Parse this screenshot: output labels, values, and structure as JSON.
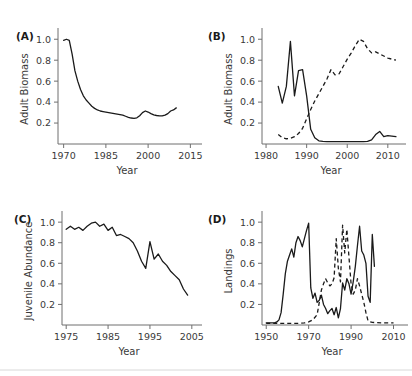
{
  "figure": {
    "background": "#ffffff",
    "line_color": "#1a1a1a",
    "axis_color": "#6f6f6f",
    "text_color": "#3a3a3a"
  },
  "panels": [
    {
      "id": "A",
      "label": "(A)"
    },
    {
      "id": "B",
      "label": "(B)"
    },
    {
      "id": "C",
      "label": "(C)"
    },
    {
      "id": "D",
      "label": "(D)"
    }
  ],
  "chart_data": [
    {
      "panel": "A",
      "type": "line",
      "title": "(A)",
      "xlabel": "Year",
      "ylabel": "Adult Biomass",
      "xlim": [
        1968,
        2017
      ],
      "ylim": [
        0.0,
        1.05
      ],
      "xticks": [
        1970,
        1985,
        2000,
        2015
      ],
      "yticks": [
        0.2,
        0.4,
        0.6,
        0.8,
        1.0
      ],
      "grid": false,
      "legend": "none",
      "series": [
        {
          "name": "adult biomass",
          "style": "solid",
          "x": [
            1970,
            1971,
            1972,
            1973,
            1974,
            1975,
            1976,
            1977,
            1978,
            1979,
            1980,
            1981,
            1982,
            1983,
            1984,
            1985,
            1986,
            1987,
            1988,
            1989,
            1990,
            1991,
            1992,
            1993,
            1994,
            1995,
            1996,
            1997,
            1998,
            1999,
            2000,
            2001,
            2002,
            2003,
            2004,
            2005,
            2006,
            2007,
            2008,
            2009,
            2010
          ],
          "values": [
            0.99,
            1.0,
            0.99,
            0.86,
            0.7,
            0.6,
            0.52,
            0.46,
            0.42,
            0.39,
            0.36,
            0.34,
            0.325,
            0.315,
            0.31,
            0.305,
            0.3,
            0.295,
            0.29,
            0.285,
            0.28,
            0.275,
            0.265,
            0.255,
            0.248,
            0.245,
            0.25,
            0.27,
            0.3,
            0.315,
            0.305,
            0.29,
            0.278,
            0.272,
            0.268,
            0.268,
            0.275,
            0.29,
            0.315,
            0.325,
            0.345
          ]
        }
      ]
    },
    {
      "panel": "B",
      "type": "line",
      "title": "(B)",
      "xlabel": "Year",
      "ylabel": "Adult Biomass",
      "xlim": [
        1979,
        2013
      ],
      "ylim": [
        0.0,
        1.05
      ],
      "xticks": [
        1980,
        1990,
        2000,
        2010
      ],
      "yticks": [
        0.2,
        0.4,
        0.6,
        0.8,
        1.0
      ],
      "grid": false,
      "legend": "none",
      "series": [
        {
          "name": "solid stock",
          "style": "solid",
          "x": [
            1983,
            1984,
            1985,
            1986,
            1987,
            1988,
            1989,
            1990,
            1991,
            1992,
            1993,
            1994,
            1995,
            1996,
            1997,
            1998,
            1999,
            2000,
            2001,
            2002,
            2003,
            2004,
            2005,
            2006,
            2007,
            2008,
            2009,
            2010,
            2011,
            2012
          ],
          "values": [
            0.55,
            0.39,
            0.55,
            0.98,
            0.46,
            0.7,
            0.71,
            0.46,
            0.14,
            0.06,
            0.03,
            0.025,
            0.022,
            0.022,
            0.022,
            0.022,
            0.022,
            0.022,
            0.022,
            0.022,
            0.022,
            0.022,
            0.025,
            0.04,
            0.09,
            0.12,
            0.07,
            0.08,
            0.075,
            0.07
          ]
        },
        {
          "name": "dashed stock",
          "style": "dashed",
          "x": [
            1983,
            1984,
            1985,
            1986,
            1987,
            1988,
            1989,
            1990,
            1991,
            1992,
            1993,
            1994,
            1995,
            1996,
            1997,
            1998,
            1999,
            2000,
            2001,
            2002,
            2003,
            2004,
            2005,
            2006,
            2007,
            2008,
            2009,
            2010,
            2011,
            2012
          ],
          "values": [
            0.09,
            0.06,
            0.05,
            0.055,
            0.07,
            0.1,
            0.15,
            0.24,
            0.33,
            0.41,
            0.48,
            0.55,
            0.62,
            0.71,
            0.66,
            0.67,
            0.74,
            0.81,
            0.87,
            0.94,
            1.0,
            0.98,
            0.91,
            0.87,
            0.88,
            0.86,
            0.84,
            0.82,
            0.81,
            0.8
          ]
        }
      ]
    },
    {
      "panel": "C",
      "type": "line",
      "title": "(C)",
      "xlabel": "Year",
      "ylabel": "Juvenile Abundance",
      "xlim": [
        1974,
        2006
      ],
      "ylim": [
        0.0,
        1.05
      ],
      "xticks": [
        1975,
        1985,
        1995,
        2005
      ],
      "yticks": [
        0.2,
        0.4,
        0.6,
        0.8,
        1.0
      ],
      "grid": false,
      "legend": "none",
      "series": [
        {
          "name": "juvenile abundance",
          "style": "solid",
          "x": [
            1975,
            1976,
            1977,
            1978,
            1979,
            1980,
            1981,
            1982,
            1983,
            1984,
            1985,
            1986,
            1987,
            1988,
            1989,
            1990,
            1991,
            1992,
            1993,
            1994,
            1995,
            1996,
            1997,
            1998,
            1999,
            2000,
            2001,
            2002,
            2003,
            2004
          ],
          "values": [
            0.93,
            0.96,
            0.93,
            0.95,
            0.92,
            0.96,
            0.99,
            1.0,
            0.96,
            0.98,
            0.92,
            0.95,
            0.87,
            0.88,
            0.86,
            0.84,
            0.8,
            0.72,
            0.62,
            0.55,
            0.81,
            0.64,
            0.69,
            0.62,
            0.58,
            0.52,
            0.48,
            0.44,
            0.35,
            0.29
          ]
        }
      ]
    },
    {
      "panel": "D",
      "type": "line",
      "title": "(D)",
      "xlabel": "Year",
      "ylabel": "Landings",
      "xlim": [
        1948,
        2014
      ],
      "ylim": [
        0.0,
        1.05
      ],
      "xticks": [
        1950,
        1970,
        1990,
        2010
      ],
      "yticks": [
        0.2,
        0.4,
        0.6,
        0.8,
        1.0
      ],
      "grid": false,
      "legend": "none",
      "series": [
        {
          "name": "solid landings",
          "style": "solid",
          "x": [
            1950,
            1951,
            1952,
            1953,
            1954,
            1955,
            1956,
            1957,
            1958,
            1959,
            1960,
            1961,
            1962,
            1963,
            1964,
            1965,
            1966,
            1967,
            1968,
            1969,
            1970,
            1971,
            1972,
            1973,
            1974,
            1975,
            1976,
            1977,
            1978,
            1979,
            1980,
            1981,
            1982,
            1983,
            1984,
            1985,
            1986,
            1987,
            1988,
            1989,
            1990,
            1991,
            1992,
            1993,
            1994,
            1995,
            1996,
            1997,
            1998,
            1999,
            2000,
            2001
          ],
          "values": [
            0.02,
            0.02,
            0.02,
            0.02,
            0.02,
            0.03,
            0.05,
            0.12,
            0.3,
            0.5,
            0.62,
            0.68,
            0.74,
            0.66,
            0.8,
            0.86,
            0.82,
            0.76,
            0.84,
            0.92,
            0.99,
            0.36,
            0.26,
            0.31,
            0.22,
            0.24,
            0.29,
            0.2,
            0.16,
            0.11,
            0.14,
            0.16,
            0.1,
            0.17,
            0.07,
            0.16,
            0.41,
            0.34,
            0.45,
            0.4,
            0.3,
            0.42,
            0.57,
            0.77,
            0.96,
            0.72,
            0.68,
            0.6,
            0.28,
            0.22,
            0.88,
            0.57
          ]
        },
        {
          "name": "dashed landings",
          "style": "dashed",
          "x": [
            1950,
            1955,
            1960,
            1965,
            1968,
            1970,
            1972,
            1974,
            1975,
            1976,
            1977,
            1978,
            1979,
            1980,
            1981,
            1982,
            1983,
            1984,
            1985,
            1986,
            1987,
            1988,
            1989,
            1990,
            1991,
            1992,
            1993,
            1994,
            1995,
            1996,
            1997,
            1998,
            1999,
            2000,
            2005,
            2010
          ],
          "values": [
            0.015,
            0.015,
            0.015,
            0.015,
            0.02,
            0.03,
            0.05,
            0.1,
            0.22,
            0.34,
            0.4,
            0.45,
            0.41,
            0.38,
            0.4,
            0.46,
            0.84,
            0.55,
            0.42,
            0.97,
            0.7,
            0.93,
            0.66,
            0.4,
            0.3,
            0.34,
            0.45,
            0.38,
            0.3,
            0.22,
            0.12,
            0.04,
            0.03,
            0.025,
            0.02,
            0.02
          ]
        }
      ]
    }
  ]
}
